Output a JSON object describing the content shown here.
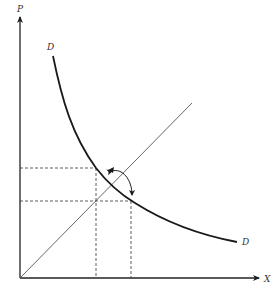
{
  "diagram": {
    "type": "supply-demand-style economic diagram",
    "axes": {
      "y_label": "P",
      "x_label": "X"
    },
    "curves": [
      {
        "name": "demand-curve",
        "label_start": "D",
        "label_end": "D",
        "shape": "downward-sloping convex hyperbola"
      },
      {
        "name": "forty-five-degree-line",
        "label": "",
        "shape": "straight line from origin"
      }
    ],
    "guides": {
      "horizontal_dashed_levels": 2,
      "vertical_dashed_levels": 2
    },
    "annotations": [
      {
        "name": "curved-double-arrow",
        "description": "double-headed arc arrow near intersection"
      }
    ],
    "colors": {
      "axis": "#222222",
      "curve": "#1a1a1a",
      "line": "#555555",
      "dashed": "#333333"
    }
  }
}
